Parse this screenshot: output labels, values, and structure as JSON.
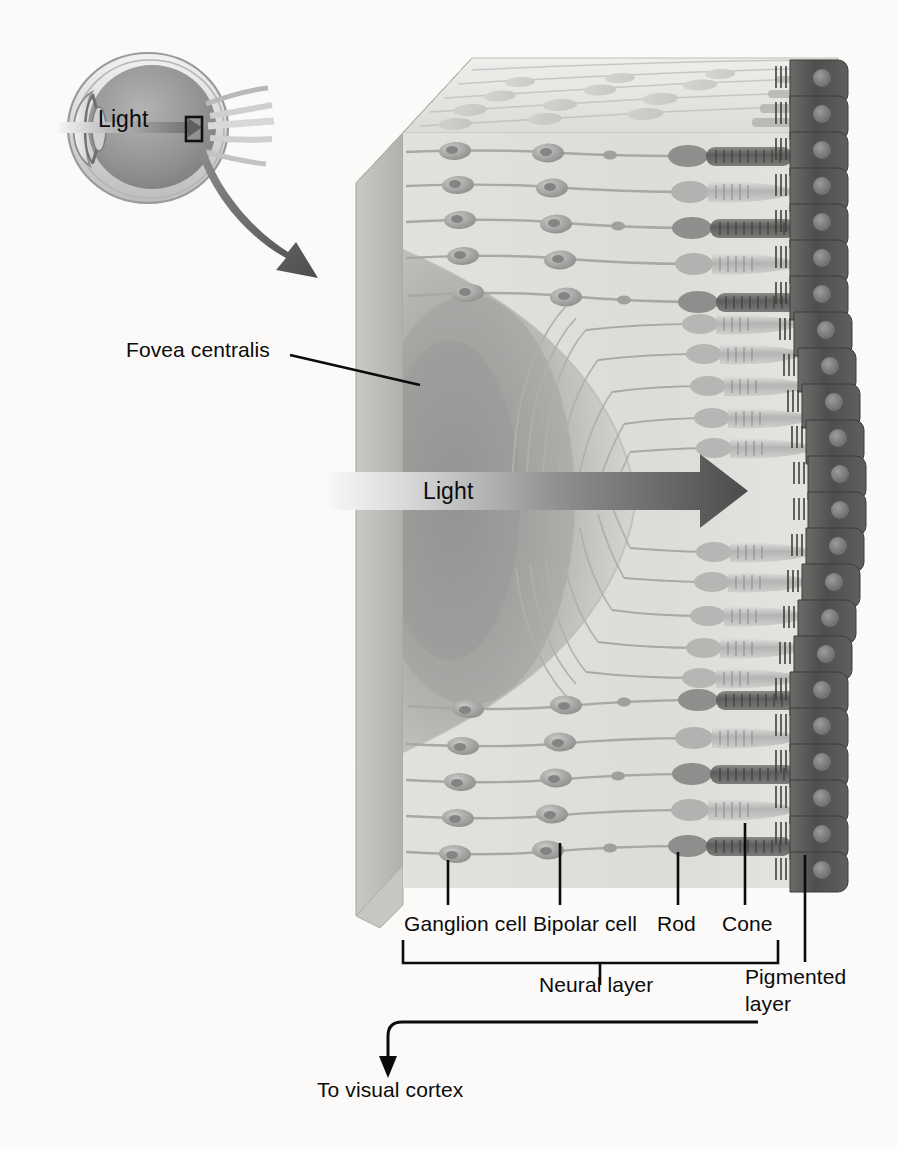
{
  "figure": {
    "background_color": "#fbfaf8"
  },
  "eye_inset": {
    "name": "eyeball-cross-section",
    "light_label": "Light",
    "colors": {
      "sclera": "#e8e8e8",
      "vitreous": "#8d8d8d",
      "outline": "#6b6b6b",
      "optic_nerve": "#d8d8d8"
    },
    "callout_box_label": "retina-magnification-box"
  },
  "retina_block": {
    "name": "retina-3d-block",
    "light_label": "Light",
    "fovea_label": "Fovea centralis",
    "colors": {
      "top_face": "#d9d9d6",
      "left_face": "#b9b9b6",
      "front_face": "#dedddb",
      "fovea_shadow": "#9a9a98",
      "cell_gray": "#9d9d9b",
      "rod_dark": "#6e6e6c",
      "cone_light": "#c2c2c0",
      "pigment_dark": "#5a5a58"
    },
    "rows": 21,
    "pigment_cell_count": 20
  },
  "callouts": [
    {
      "id": "ganglion",
      "label": "Ganglion cell",
      "leader_x": 448
    },
    {
      "id": "bipolar",
      "label": "Bipolar cell",
      "leader_x": 560
    },
    {
      "id": "rod",
      "label": "Rod",
      "leader_x": 678
    },
    {
      "id": "cone",
      "label": "Cone",
      "leader_x": 745
    },
    {
      "id": "pigmented",
      "label": "Pigmented",
      "leader_x": 805
    }
  ],
  "labels": {
    "ganglion_cell": "Ganglion cell",
    "bipolar_cell": "Bipolar cell",
    "rod": "Rod",
    "cone": "Cone",
    "neural_layer": "Neural layer",
    "pigmented_layer_line1": "Pigmented",
    "pigmented_layer_line2": "layer",
    "fovea_centralis": "Fovea centralis",
    "light_eye": "Light",
    "light_retina": "Light",
    "to_visual_cortex": "To visual cortex"
  },
  "brackets": {
    "neural_layer": {
      "x_start": 403,
      "x_end": 778,
      "tick_x": 600
    }
  },
  "axon_arrow": {
    "name": "to-visual-cortex-arrow",
    "start_x": 758,
    "turn_x": 390,
    "y": 1022,
    "arrow_tip_y": 1072
  }
}
